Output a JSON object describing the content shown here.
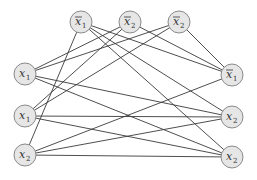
{
  "diagram": {
    "type": "graph",
    "node_radius": 11,
    "colors": {
      "edge": "#3a3a3a",
      "node_fill": "#e6e6e6",
      "node_stroke": "#8a8a8a",
      "text": "#333333"
    },
    "nodes": [
      {
        "id": "T1",
        "var": "x",
        "sub": "1",
        "negated": true,
        "x": 81,
        "y": 22
      },
      {
        "id": "T2",
        "var": "x",
        "sub": "2",
        "negated": true,
        "x": 130,
        "y": 22
      },
      {
        "id": "T3",
        "var": "x",
        "sub": "2",
        "negated": true,
        "x": 179,
        "y": 22
      },
      {
        "id": "L1",
        "var": "x",
        "sub": "1",
        "negated": false,
        "x": 25,
        "y": 74
      },
      {
        "id": "L2",
        "var": "x",
        "sub": "1",
        "negated": false,
        "x": 25,
        "y": 116
      },
      {
        "id": "L3",
        "var": "x",
        "sub": "2",
        "negated": false,
        "x": 25,
        "y": 155
      },
      {
        "id": "R1",
        "var": "x",
        "sub": "1",
        "negated": true,
        "x": 232,
        "y": 75
      },
      {
        "id": "R2",
        "var": "x",
        "sub": "2",
        "negated": false,
        "x": 232,
        "y": 117
      },
      {
        "id": "R3",
        "var": "x",
        "sub": "2",
        "negated": false,
        "x": 232,
        "y": 157
      }
    ],
    "edges": [
      [
        "T1",
        "L3"
      ],
      [
        "T1",
        "R1"
      ],
      [
        "T1",
        "R2"
      ],
      [
        "T1",
        "R3"
      ],
      [
        "T2",
        "L1"
      ],
      [
        "T2",
        "L2"
      ],
      [
        "T2",
        "R1"
      ],
      [
        "T3",
        "L1"
      ],
      [
        "T3",
        "L2"
      ],
      [
        "T3",
        "R1"
      ],
      [
        "L1",
        "R2"
      ],
      [
        "L1",
        "R3"
      ],
      [
        "L2",
        "R2"
      ],
      [
        "L2",
        "R3"
      ],
      [
        "L3",
        "R1"
      ],
      [
        "L3",
        "R2"
      ],
      [
        "L3",
        "R3"
      ]
    ]
  }
}
